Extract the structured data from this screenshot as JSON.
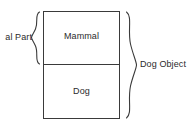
{
  "diagram": {
    "background_color": "#ffffff",
    "stroke_color": "#3a3a3a",
    "text_color": "#2b2b2b",
    "boxes": [
      {
        "id": "mammal",
        "label": "Mammal"
      },
      {
        "id": "dog",
        "label": "Dog"
      }
    ],
    "braces": [
      {
        "id": "left-brace",
        "label": "al Part",
        "side": "left",
        "spans": "mammal",
        "clipped": true
      },
      {
        "id": "right-brace",
        "label": "Dog Object",
        "side": "right",
        "spans": "mammal+dog",
        "clipped": false
      }
    ]
  }
}
